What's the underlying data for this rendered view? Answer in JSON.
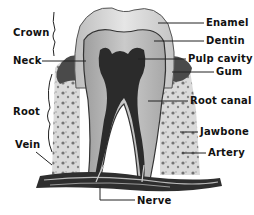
{
  "diagram": {
    "left_labels": {
      "crown": "Crown",
      "neck": "Neck",
      "root": "Root",
      "vein": "Vein"
    },
    "right_labels": {
      "enamel": "Enamel",
      "dentin": "Dentin",
      "pulp_cavity": "Pulp cavity",
      "gum": "Gum",
      "root_canal": "Root canal",
      "jawbone": "Jawbone",
      "artery": "Artery"
    },
    "bottom_labels": {
      "nerve": "Nerve"
    },
    "colors": {
      "background": "#ffffff",
      "enamel": "#d8d8d8",
      "dentin": "#b8b8b8",
      "pulp": "#2a2a2a",
      "gum": "#555555",
      "bone": "#cfcfcf",
      "ink": "#111111"
    }
  }
}
